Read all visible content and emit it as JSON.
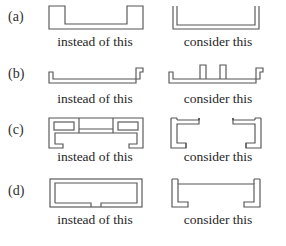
{
  "figure": {
    "stroke_color": "#555555",
    "background_color": "#ffffff",
    "text_color": "#2b2b2b",
    "caption_left": "instead of this",
    "caption_right": "consider this",
    "rows": [
      {
        "key": "a",
        "label": "(a)",
        "caption_left": "instead of this",
        "caption_right": "consider this",
        "left_shape_name": "closed-box-channel-with-raised-ends",
        "right_shape_name": "thin-wall-u-channel-open",
        "left_shape_desc": "Channel outline drawn as a single closed boundary with tall square end posts and a flat raised base",
        "right_shape_desc": "Thin-walled U channel formed from a constant-thickness double line with vertical legs"
      },
      {
        "key": "b",
        "label": "(b)",
        "caption_left": "instead of this",
        "caption_right": "consider this",
        "left_shape_name": "flat-plate-with-end-lips",
        "right_shape_name": "flat-plate-with-end-lips-and-stiffener-ribs",
        "left_shape_desc": "Long thin flat strip with a small upturned lip at the left end and at the right end",
        "right_shape_desc": "Same flat strip with two upward stiffening ribs added near the middle of the span"
      },
      {
        "key": "c",
        "label": "(c)",
        "caption_left": "instead of this",
        "caption_right": "consider this",
        "left_shape_name": "hat-section-with-closed-corner-boxes",
        "right_shape_name": "open-hat-section-with-return-lips",
        "left_shape_desc": "Hat section whose upper corners are fully closed rectangular boxes, with inward return lips at the bottom of each leg",
        "right_shape_desc": "Open hat section of uniform thin wall, central raised crown, and short inward return lips at the bottom of each leg"
      },
      {
        "key": "d",
        "label": "(d)",
        "caption_left": "instead of this",
        "caption_right": "consider this",
        "left_shape_name": "closed-rectangular-tube-with-bottom-slit",
        "right_shape_name": "open-u-channel-with-return-lips",
        "left_shape_desc": "Thin-walled rectangular tube closed on all four sides except for a narrow slit at the bottom centre",
        "right_shape_desc": "Open U channel of uniform thin wall with short inward return lips at the bottom of each leg"
      }
    ]
  }
}
